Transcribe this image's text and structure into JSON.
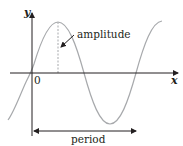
{
  "diagram": {
    "axes": {
      "x_label": "x",
      "y_label": "y",
      "origin_label": "0"
    },
    "annotations": {
      "amplitude_label": "amplitude",
      "period_label": "period"
    },
    "colors": {
      "axis": "#231f20",
      "curve": "#a7a9ac",
      "text": "#231f20",
      "dashed": "#a7a9ac"
    }
  }
}
